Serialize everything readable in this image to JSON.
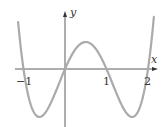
{
  "chart_data": {
    "type": "line",
    "title": "",
    "xlabel": "x",
    "ylabel": "y",
    "function": "y = x(x+1)(x-1)(x-2)",
    "x_ticks": [
      "-1",
      "1",
      "2"
    ],
    "x_tick_values": [
      -1,
      1,
      2
    ],
    "roots": [
      -1,
      0,
      1,
      2
    ],
    "xlim": [
      -1.2,
      2.25
    ],
    "ylim": [
      -1.1,
      1.2
    ],
    "grid": false,
    "legend": null,
    "series": [
      {
        "name": "curve",
        "x": [
          -1.15,
          -1.0,
          -0.8,
          -0.618,
          -0.4,
          -0.2,
          0.0,
          0.2,
          0.4,
          0.5,
          0.6,
          0.8,
          1.0,
          1.2,
          1.4,
          1.618,
          1.8,
          2.0,
          2.15
        ],
        "values": [
          1.12,
          0.0,
          -0.72,
          -1.0,
          -0.81,
          -0.42,
          0.0,
          0.34,
          0.55,
          0.56,
          0.54,
          0.35,
          0.0,
          -0.42,
          -0.81,
          -1.0,
          -0.72,
          0.0,
          1.12
        ]
      }
    ],
    "colors": {
      "curve": "#aaaaaa",
      "axes": "#333333"
    }
  },
  "labels": {
    "x_axis": "x",
    "y_axis": "y",
    "tick_neg1": "−1",
    "tick_1": "1",
    "tick_2": "2"
  }
}
